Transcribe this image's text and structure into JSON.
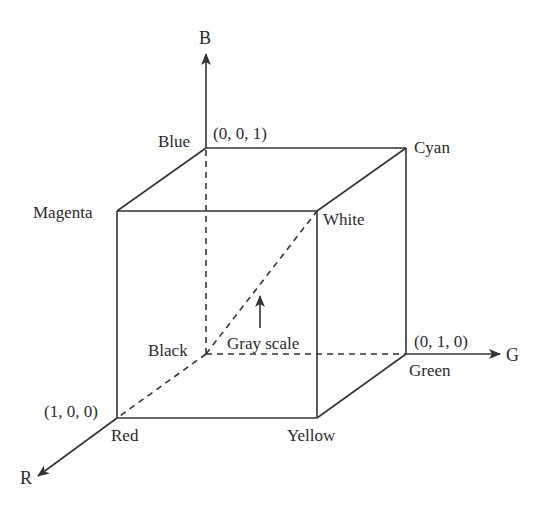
{
  "diagram": {
    "axes": {
      "b": {
        "label": "B"
      },
      "g": {
        "label": "G"
      },
      "r": {
        "label": "R"
      }
    },
    "vertices": {
      "black": {
        "label": "Black",
        "rgb": [
          0,
          0,
          0
        ]
      },
      "red": {
        "label": "Red",
        "rgb": [
          1,
          0,
          0
        ],
        "coord_label": "(1, 0, 0)"
      },
      "green": {
        "label": "Green",
        "rgb": [
          0,
          1,
          0
        ],
        "coord_label": "(0, 1, 0)"
      },
      "blue": {
        "label": "Blue",
        "rgb": [
          0,
          0,
          1
        ],
        "coord_label": "(0, 0, 1)"
      },
      "cyan": {
        "label": "Cyan",
        "rgb": [
          0,
          1,
          1
        ]
      },
      "magenta": {
        "label": "Magenta",
        "rgb": [
          1,
          0,
          1
        ]
      },
      "yellow": {
        "label": "Yellow",
        "rgb": [
          1,
          1,
          0
        ]
      },
      "white": {
        "label": "White",
        "rgb": [
          1,
          1,
          1
        ]
      }
    },
    "annotations": {
      "gray_scale": "Gray scale"
    },
    "colors": {
      "line": "#333333",
      "text": "#2a2a2a",
      "background": "#ffffff"
    }
  }
}
